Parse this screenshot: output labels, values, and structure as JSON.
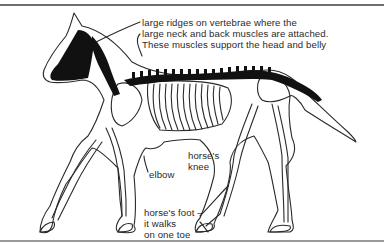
{
  "figure": {
    "colors": {
      "outline": "#2a2a2a",
      "highlight": "#111111",
      "background": "#ffffff"
    },
    "labels": {
      "ridges": {
        "lines": [
          "large ridges on vertebrae where the",
          "large neck and back muscles are attached.",
          "These muscles support the head and belly"
        ]
      },
      "elbow": "elbow",
      "knee": {
        "lines": [
          "horse's",
          "knee"
        ]
      },
      "foot": {
        "lines": [
          "horse's foot –",
          "it walks",
          "on one toe"
        ]
      }
    }
  }
}
